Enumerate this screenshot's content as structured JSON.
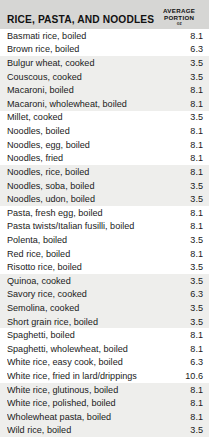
{
  "table": {
    "section_title": "RICE, PASTA, AND NOODLES",
    "column_header": {
      "line1": "AVERAGE",
      "line2": "PORTION",
      "unit": "oz"
    },
    "colors": {
      "header_background": "#d6d6d4",
      "row_shaded_background": "#eeeeec",
      "row_background": "#ffffff",
      "text": "#1a1a1a"
    },
    "rows": [
      {
        "label": "Basmati rice, boiled",
        "portion": "8.1",
        "shaded": false
      },
      {
        "label": "Brown rice, boiled",
        "portion": "6.3",
        "shaded": false
      },
      {
        "label": "Bulgur wheat, cooked",
        "portion": "3.5",
        "shaded": true
      },
      {
        "label": "Couscous, cooked",
        "portion": "3.5",
        "shaded": true
      },
      {
        "label": "Macaroni, boiled",
        "portion": "8.1",
        "shaded": true
      },
      {
        "label": "Macaroni, wholewheat, boiled",
        "portion": "8.1",
        "shaded": true
      },
      {
        "label": "Millet, cooked",
        "portion": "3.5",
        "shaded": false
      },
      {
        "label": "Noodles, boiled",
        "portion": "8.1",
        "shaded": false
      },
      {
        "label": "Noodles, egg, boiled",
        "portion": "8.1",
        "shaded": false
      },
      {
        "label": "Noodles, fried",
        "portion": "8.1",
        "shaded": false
      },
      {
        "label": "Noodles, rice, boiled",
        "portion": "8.1",
        "shaded": true
      },
      {
        "label": "Noodles, soba, boiled",
        "portion": "3.5",
        "shaded": true
      },
      {
        "label": "Noodles, udon, boiled",
        "portion": "3.5",
        "shaded": true
      },
      {
        "label": "Pasta, fresh egg, boiled",
        "portion": "8.1",
        "shaded": false
      },
      {
        "label": "Pasta twists/Italian fusilli, boiled",
        "portion": "8.1",
        "shaded": false
      },
      {
        "label": "Polenta, boiled",
        "portion": "3.5",
        "shaded": false
      },
      {
        "label": "Red rice, boiled",
        "portion": "8.1",
        "shaded": false
      },
      {
        "label": "Risotto rice, boiled",
        "portion": "3.5",
        "shaded": false
      },
      {
        "label": "Quinoa, cooked",
        "portion": "3.5",
        "shaded": true
      },
      {
        "label": "Savory rice, cooked",
        "portion": "6.3",
        "shaded": true
      },
      {
        "label": "Semolina, cooked",
        "portion": "3.5",
        "shaded": true
      },
      {
        "label": "Short grain rice, boiled",
        "portion": "3.5",
        "shaded": true
      },
      {
        "label": "Spaghetti, boiled",
        "portion": "8.1",
        "shaded": false
      },
      {
        "label": "Spaghetti, wholewheat, boiled",
        "portion": "8.1",
        "shaded": false
      },
      {
        "label": "White rice, easy cook, boiled",
        "portion": "6.3",
        "shaded": false
      },
      {
        "label": "White rice, fried in lard/drippings",
        "portion": "10.6",
        "shaded": false
      },
      {
        "label": "White rice, glutinous, boiled",
        "portion": "8.1",
        "shaded": true
      },
      {
        "label": "White rice, polished, boiled",
        "portion": "8.1",
        "shaded": true
      },
      {
        "label": "Wholewheat pasta, boiled",
        "portion": "8.1",
        "shaded": true
      },
      {
        "label": "Wild rice, boiled",
        "portion": "3.5",
        "shaded": true
      }
    ]
  }
}
